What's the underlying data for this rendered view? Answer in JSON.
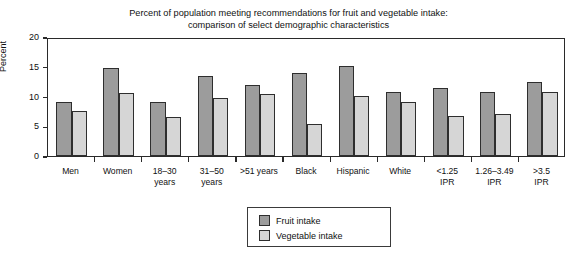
{
  "chart_data": {
    "type": "bar",
    "title": "Percent of population meeting recommendations for fruit and vegetable intake: comparison of select demographic characteristics",
    "title_line1": "Percent of population meeting recommendations for fruit and vegetable intake:",
    "title_line2": "comparison of select demographic characteristics",
    "xlabel": "",
    "ylabel": "Percent",
    "ylim": [
      0,
      20
    ],
    "yticks": [
      0,
      5,
      10,
      15,
      20
    ],
    "ytick_labels": [
      "0",
      "5",
      "10",
      "15",
      "20"
    ],
    "grid": false,
    "legend_position": "bottom-center",
    "categories": [
      "Men",
      "Women",
      "18–30 years",
      "31–50 years",
      ">51 years",
      "Black",
      "Hispanic",
      "White",
      "<1.25 IPR",
      "1.26–3.49 IPR",
      ">3.5 IPR"
    ],
    "category_lines": [
      [
        "Men",
        ""
      ],
      [
        "Women",
        ""
      ],
      [
        "18–30",
        "years"
      ],
      [
        "31–50",
        "years"
      ],
      [
        ">51 years",
        ""
      ],
      [
        "Black",
        ""
      ],
      [
        "Hispanic",
        ""
      ],
      [
        "White",
        ""
      ],
      [
        "<1.25",
        "IPR"
      ],
      [
        "1.26–3.49",
        "IPR"
      ],
      [
        ">3.5",
        "IPR"
      ]
    ],
    "series": [
      {
        "name": "Fruit intake",
        "color": "#9c9c9c",
        "values": [
          9.0,
          14.8,
          9.0,
          13.5,
          12.0,
          13.9,
          15.2,
          10.7,
          11.5,
          10.7,
          12.4
        ]
      },
      {
        "name": "Vegetable intake",
        "color": "#d6d6d6",
        "values": [
          7.5,
          10.6,
          6.6,
          9.7,
          10.5,
          5.3,
          10.1,
          9.1,
          6.7,
          7.1,
          10.8
        ]
      }
    ]
  },
  "legend": {
    "items": [
      {
        "label": "Fruit intake",
        "color": "#9c9c9c"
      },
      {
        "label": "Vegetable intake",
        "color": "#d6d6d6"
      }
    ]
  }
}
